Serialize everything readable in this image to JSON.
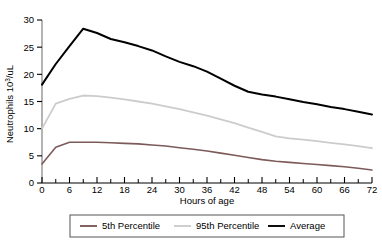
{
  "chart_data": {
    "type": "line",
    "title": "",
    "xlabel": "Hours of age",
    "ylabel": "Neutrophils 10³/uL",
    "ylabel_base": "Neutrophils 10",
    "ylabel_exp": "3",
    "ylabel_tail": "/uL",
    "xlim": [
      0,
      72
    ],
    "ylim": [
      0,
      30
    ],
    "xticks": [
      0,
      6,
      12,
      18,
      24,
      30,
      36,
      42,
      48,
      54,
      60,
      66,
      72
    ],
    "xtick_labels": [
      "0",
      "6",
      "12",
      "18",
      "24",
      "30",
      "36",
      "42",
      "48",
      "54",
      "60",
      "66",
      "72"
    ],
    "xminor_step": 3,
    "yticks": [
      0,
      5,
      10,
      15,
      20,
      25,
      30
    ],
    "ytick_labels": [
      "0",
      "5",
      "10",
      "15",
      "20",
      "25",
      "30"
    ],
    "grid": false,
    "legend_position": "bottom",
    "x": [
      0,
      3,
      6,
      9,
      12,
      15,
      18,
      21,
      24,
      27,
      30,
      33,
      36,
      39,
      42,
      45,
      48,
      51,
      54,
      57,
      60,
      63,
      66,
      69,
      72
    ],
    "series": [
      {
        "name": "5th Percentile",
        "color": "#7d5a5a",
        "width": 1.6,
        "values": [
          3.5,
          6.6,
          7.5,
          7.5,
          7.5,
          7.4,
          7.3,
          7.2,
          7.0,
          6.8,
          6.5,
          6.2,
          5.9,
          5.5,
          5.1,
          4.7,
          4.3,
          4.0,
          3.8,
          3.6,
          3.4,
          3.2,
          3.0,
          2.7,
          2.4
        ]
      },
      {
        "name": "95th Percentile",
        "color": "#cccccc",
        "width": 1.8,
        "values": [
          10.0,
          14.6,
          15.5,
          16.1,
          16.0,
          15.7,
          15.4,
          15.0,
          14.6,
          14.1,
          13.6,
          13.0,
          12.4,
          11.7,
          11.0,
          10.2,
          9.4,
          8.6,
          8.2,
          8.0,
          7.7,
          7.4,
          7.1,
          6.8,
          6.4
        ]
      },
      {
        "name": "Average",
        "color": "#000000",
        "width": 2.0,
        "values": [
          18.1,
          21.9,
          25.2,
          28.4,
          27.6,
          26.5,
          25.9,
          25.2,
          24.4,
          23.3,
          22.3,
          21.5,
          20.5,
          19.2,
          17.9,
          16.8,
          16.3,
          15.9,
          15.4,
          14.9,
          14.5,
          14.0,
          13.6,
          13.1,
          12.6
        ]
      }
    ]
  },
  "legend": {
    "items": [
      {
        "label": "5th Percentile",
        "color": "#7d5a5a"
      },
      {
        "label": "95th Percentile",
        "color": "#cccccc"
      },
      {
        "label": "Average",
        "color": "#000000"
      }
    ],
    "border_color": "#555555"
  }
}
